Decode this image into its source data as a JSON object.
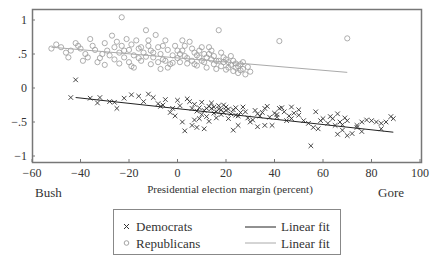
{
  "chart_data": {
    "type": "scatter",
    "title": "",
    "xlabel": "Presidential election margin (percent)",
    "ylabel": "",
    "xlim": [
      -60,
      100
    ],
    "ylim": [
      -1.1,
      1.15
    ],
    "x_ticks": [
      -60,
      -40,
      -20,
      0,
      20,
      40,
      60,
      80,
      100
    ],
    "x_tick_labels": [
      "−60",
      "−40",
      "−20",
      "0",
      "20",
      "40",
      "60",
      "80",
      "100"
    ],
    "y_ticks": [
      1,
      0.5,
      0,
      -0.5,
      -1
    ],
    "y_tick_labels": [
      "1",
      ".5",
      "0",
      "−.5",
      "−1"
    ],
    "annotations": {
      "left": "Bush",
      "right": "Gore"
    },
    "grid": false,
    "legend_position": "bottom-center",
    "series": [
      {
        "name": "Democrats",
        "marker": "x",
        "color": "#333333",
        "points": [
          [
            -42,
            0.12
          ],
          [
            -44,
            -0.14
          ],
          [
            -36,
            -0.15
          ],
          [
            -33,
            -0.22
          ],
          [
            -32,
            -0.14
          ],
          [
            -28,
            -0.2
          ],
          [
            -26,
            -0.21
          ],
          [
            -25,
            -0.3
          ],
          [
            -22,
            -0.15
          ],
          [
            -19,
            -0.1
          ],
          [
            -16,
            -0.12
          ],
          [
            -14,
            -0.2
          ],
          [
            -12,
            -0.09
          ],
          [
            -10,
            -0.14
          ],
          [
            -8,
            -0.23
          ],
          [
            -6,
            -0.25
          ],
          [
            -7,
            -0.27
          ],
          [
            -5,
            -0.17
          ],
          [
            -2,
            -0.3
          ],
          [
            -3,
            -0.36
          ],
          [
            0,
            -0.18
          ],
          [
            1,
            -0.26
          ],
          [
            -1,
            -0.41
          ],
          [
            2,
            -0.5
          ],
          [
            3,
            -0.63
          ],
          [
            4,
            -0.16
          ],
          [
            5,
            -0.2
          ],
          [
            6,
            -0.3
          ],
          [
            7,
            -0.24
          ],
          [
            8,
            -0.34
          ],
          [
            9,
            -0.29
          ],
          [
            10,
            -0.21
          ],
          [
            11,
            -0.33
          ],
          [
            12,
            -0.42
          ],
          [
            13,
            -0.49
          ],
          [
            14,
            -0.3
          ],
          [
            15,
            -0.28
          ],
          [
            16,
            -0.35
          ],
          [
            17,
            -0.31
          ],
          [
            18,
            -0.39
          ],
          [
            19,
            -0.25
          ],
          [
            20,
            -0.33
          ],
          [
            21,
            -0.45
          ],
          [
            22,
            -0.38
          ],
          [
            23,
            -0.32
          ],
          [
            24,
            -0.29
          ],
          [
            25,
            -0.41
          ],
          [
            26,
            -0.36
          ],
          [
            14,
            -0.22
          ],
          [
            15,
            -0.37
          ],
          [
            16,
            -0.44
          ],
          [
            17,
            -0.26
          ],
          [
            18,
            -0.32
          ],
          [
            19,
            -0.36
          ],
          [
            12,
            -0.3
          ],
          [
            13,
            -0.27
          ],
          [
            10,
            -0.39
          ],
          [
            11,
            -0.6
          ],
          [
            9,
            -0.45
          ],
          [
            7,
            -0.47
          ],
          [
            6,
            -0.55
          ],
          [
            8,
            -0.58
          ],
          [
            20,
            -0.28
          ],
          [
            21,
            -0.31
          ],
          [
            27,
            -0.28
          ],
          [
            28,
            -0.35
          ],
          [
            29,
            -0.44
          ],
          [
            30,
            -0.5
          ],
          [
            31,
            -0.47
          ],
          [
            32,
            -0.33
          ],
          [
            33,
            -0.38
          ],
          [
            34,
            -0.41
          ],
          [
            35,
            -0.36
          ],
          [
            36,
            -0.3
          ],
          [
            37,
            -0.27
          ],
          [
            38,
            -0.43
          ],
          [
            39,
            -0.55
          ],
          [
            40,
            -0.37
          ],
          [
            41,
            -0.39
          ],
          [
            42,
            -0.3
          ],
          [
            43,
            -0.29
          ],
          [
            44,
            -0.35
          ],
          [
            45,
            -0.48
          ],
          [
            46,
            -0.41
          ],
          [
            47,
            -0.28
          ],
          [
            48,
            -0.37
          ],
          [
            50,
            -0.4
          ],
          [
            52,
            -0.48
          ],
          [
            55,
            -0.85
          ],
          [
            56,
            -0.58
          ],
          [
            58,
            -0.6
          ],
          [
            60,
            -0.45
          ],
          [
            62,
            -0.52
          ],
          [
            63,
            -0.42
          ],
          [
            64,
            -0.45
          ],
          [
            65,
            -0.55
          ],
          [
            66,
            -0.38
          ],
          [
            67,
            -0.5
          ],
          [
            68,
            -0.54
          ],
          [
            69,
            -0.44
          ],
          [
            70,
            -0.48
          ],
          [
            72,
            -0.67
          ],
          [
            74,
            -0.55
          ],
          [
            76,
            -0.5
          ],
          [
            78,
            -0.47
          ],
          [
            80,
            -0.48
          ],
          [
            82,
            -0.5
          ],
          [
            84,
            -0.6
          ],
          [
            86,
            -0.5
          ],
          [
            88,
            -0.42
          ],
          [
            89,
            -0.45
          ],
          [
            84,
            -0.52
          ],
          [
            23,
            -0.62
          ],
          [
            24,
            -0.4
          ],
          [
            25,
            -0.55
          ],
          [
            33,
            -0.57
          ],
          [
            36,
            -0.55
          ],
          [
            54,
            -0.52
          ],
          [
            57,
            -0.35
          ],
          [
            59,
            -0.48
          ],
          [
            66,
            -0.68
          ],
          [
            68,
            -0.62
          ],
          [
            70,
            -0.7
          ],
          [
            74,
            -0.58
          ],
          [
            76,
            -0.64
          ],
          [
            47,
            -0.45
          ],
          [
            41,
            -0.43
          ],
          [
            50,
            -0.32
          ]
        ],
        "fit": {
          "name": "Linear fit",
          "color": "#222222",
          "x": [
            -42,
            89
          ],
          "y": [
            -0.14,
            -0.65
          ]
        }
      },
      {
        "name": "Republicans",
        "marker": "o",
        "color": "#999999",
        "points": [
          [
            -23,
            1.04
          ],
          [
            17,
            0.85
          ],
          [
            42,
            0.69
          ],
          [
            70,
            0.73
          ],
          [
            -52,
            0.58
          ],
          [
            -50,
            0.64
          ],
          [
            -48,
            0.6
          ],
          [
            -46,
            0.52
          ],
          [
            -44,
            0.55
          ],
          [
            -42,
            0.66
          ],
          [
            -40,
            0.58
          ],
          [
            -38,
            0.5
          ],
          [
            -36,
            0.72
          ],
          [
            -35,
            0.62
          ],
          [
            -34,
            0.56
          ],
          [
            -32,
            0.44
          ],
          [
            -30,
            0.66
          ],
          [
            -29,
            0.55
          ],
          [
            -28,
            0.48
          ],
          [
            -27,
            0.77
          ],
          [
            -26,
            0.6
          ],
          [
            -25,
            0.68
          ],
          [
            -24,
            0.52
          ],
          [
            -23,
            0.62
          ],
          [
            -22,
            0.45
          ],
          [
            -21,
            0.72
          ],
          [
            -20,
            0.56
          ],
          [
            -19,
            0.64
          ],
          [
            -18,
            0.48
          ],
          [
            -17,
            0.7
          ],
          [
            -16,
            0.58
          ],
          [
            -15,
            0.4
          ],
          [
            -14,
            0.52
          ],
          [
            -13,
            0.85
          ],
          [
            -12,
            0.62
          ],
          [
            -11,
            0.55
          ],
          [
            -10,
            0.45
          ],
          [
            -9,
            0.78
          ],
          [
            -8,
            0.6
          ],
          [
            -7,
            0.5
          ],
          [
            -6,
            0.42
          ],
          [
            -5,
            0.7
          ],
          [
            -4,
            0.56
          ],
          [
            -3,
            0.35
          ],
          [
            -2,
            0.48
          ],
          [
            -1,
            0.62
          ],
          [
            0,
            0.44
          ],
          [
            1,
            0.38
          ],
          [
            2,
            0.55
          ],
          [
            3,
            0.47
          ],
          [
            4,
            0.36
          ],
          [
            5,
            0.68
          ],
          [
            6,
            0.4
          ],
          [
            7,
            0.52
          ],
          [
            8,
            0.33
          ],
          [
            9,
            0.45
          ],
          [
            10,
            0.6
          ],
          [
            11,
            0.38
          ],
          [
            12,
            0.3
          ],
          [
            13,
            0.5
          ],
          [
            14,
            0.42
          ],
          [
            15,
            0.35
          ],
          [
            16,
            0.28
          ],
          [
            17,
            0.4
          ],
          [
            18,
            0.32
          ],
          [
            19,
            0.45
          ],
          [
            20,
            0.27
          ],
          [
            21,
            0.38
          ],
          [
            22,
            0.34
          ],
          [
            23,
            0.25
          ],
          [
            24,
            0.3
          ],
          [
            25,
            0.22
          ],
          [
            26,
            0.35
          ],
          [
            27,
            0.28
          ],
          [
            28,
            0.2
          ],
          [
            29,
            0.31
          ],
          [
            30,
            0.24
          ],
          [
            -31,
            0.5
          ],
          [
            -33,
            0.38
          ],
          [
            -37,
            0.45
          ],
          [
            -20,
            0.38
          ],
          [
            -18,
            0.3
          ],
          [
            -15,
            0.6
          ],
          [
            -11,
            0.35
          ],
          [
            -8,
            0.38
          ],
          [
            -4,
            0.3
          ],
          [
            0,
            0.55
          ],
          [
            3,
            0.62
          ],
          [
            6,
            0.58
          ],
          [
            9,
            0.55
          ],
          [
            11,
            0.5
          ],
          [
            13,
            0.6
          ],
          [
            15,
            0.47
          ],
          [
            18,
            0.52
          ],
          [
            20,
            0.42
          ],
          [
            22,
            0.47
          ],
          [
            -26,
            0.42
          ],
          [
            -24,
            0.36
          ],
          [
            -19,
            0.32
          ],
          [
            -16,
            0.44
          ],
          [
            -13,
            0.46
          ],
          [
            -10,
            0.52
          ],
          [
            -7,
            0.28
          ],
          [
            -5,
            0.4
          ],
          [
            -2,
            0.37
          ],
          [
            1,
            0.5
          ],
          [
            4,
            0.44
          ],
          [
            7,
            0.35
          ],
          [
            10,
            0.4
          ],
          [
            12,
            0.45
          ],
          [
            14,
            0.55
          ],
          [
            16,
            0.4
          ],
          [
            19,
            0.38
          ],
          [
            21,
            0.3
          ],
          [
            23,
            0.4
          ],
          [
            25,
            0.32
          ],
          [
            27,
            0.38
          ],
          [
            -45,
            0.45
          ],
          [
            -41,
            0.62
          ],
          [
            -39,
            0.4
          ],
          [
            -30,
            0.34
          ],
          [
            -22,
            0.55
          ],
          [
            -12,
            0.7
          ],
          [
            -6,
            0.62
          ],
          [
            2,
            0.7
          ],
          [
            8,
            0.48
          ],
          [
            24,
            0.36
          ],
          [
            26,
            0.26
          ]
        ],
        "fit": {
          "name": "Linear fit",
          "color": "#aaaaaa",
          "x": [
            -52,
            70
          ],
          "y": [
            0.6,
            0.23
          ]
        }
      }
    ],
    "legend": [
      {
        "label": "Democrats",
        "marker": "x"
      },
      {
        "label": "Linear fit",
        "line_color": "#222222"
      },
      {
        "label": "Republicans",
        "marker": "o"
      },
      {
        "label": "Linear fit",
        "line_color": "#aaaaaa"
      }
    ]
  },
  "layout": {
    "plot": {
      "left": 32,
      "right": 421,
      "top": 9,
      "bottom": 162
    },
    "x_origin_px": 177.5,
    "x_px_per_unit": 2.425,
    "y_origin_px": 88,
    "y_px_per_unit": 68
  }
}
